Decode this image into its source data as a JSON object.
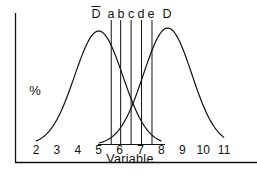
{
  "chart_data": {
    "type": "line",
    "title": "",
    "xlabel": "Variable",
    "ylabel": "%",
    "xlim": [
      2,
      11
    ],
    "x_ticks": [
      "2",
      "3",
      "4",
      "5",
      "6",
      "7",
      "8",
      "9",
      "10",
      "11"
    ],
    "grid": false,
    "legend": "none; curves labeled at top",
    "series": [
      {
        "name": "D̄ (non-diseased)",
        "label": "D",
        "overline": true,
        "shape": "normal",
        "mean": 5.0,
        "range": [
          2,
          8
        ],
        "peak_relative": 0.97
      },
      {
        "name": "D (diseased)",
        "label": "D",
        "overline": false,
        "shape": "normal",
        "mean": 8.3,
        "range": [
          5,
          11
        ],
        "peak_relative": 1.0
      }
    ],
    "cutoff_lines": [
      {
        "label": "a",
        "x": 5.6
      },
      {
        "label": "b",
        "x": 6.05
      },
      {
        "label": "c",
        "x": 6.55
      },
      {
        "label": "d",
        "x": 7.05
      },
      {
        "label": "e",
        "x": 7.55
      }
    ],
    "annotations": [
      "D̄",
      "a",
      "b",
      "c",
      "d",
      "e",
      "D"
    ]
  },
  "labels": {
    "ylabel": "%",
    "xlabel": "Variable",
    "dbar": "D",
    "d": "D",
    "cut_a": "a",
    "cut_b": "b",
    "cut_c": "c",
    "cut_d": "d",
    "cut_e": "e",
    "ticks": [
      "2",
      "3",
      "4",
      "5",
      "6",
      "7",
      "8",
      "9",
      "10",
      "11"
    ]
  },
  "colors": {
    "ink": "#111111",
    "background": "#ffffff"
  }
}
